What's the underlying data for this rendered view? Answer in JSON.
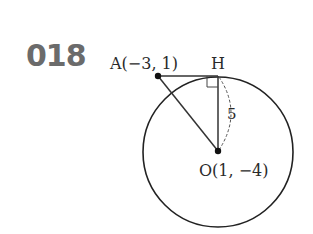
{
  "problem": {
    "number": "018"
  },
  "labels": {
    "point_a": "A(−3, 1)",
    "point_h": "H",
    "point_o": "O(1, −4)",
    "distance": "5"
  },
  "diagram": {
    "center": {
      "name": "O",
      "coords": [
        1,
        -4
      ]
    },
    "external_point": {
      "name": "A",
      "coords": [
        -3,
        1
      ]
    },
    "tangent_point": {
      "name": "H"
    },
    "radius": 5,
    "right_angle_at": "H",
    "stroke_color": "#222222",
    "number_color": "#6b6b6b"
  }
}
